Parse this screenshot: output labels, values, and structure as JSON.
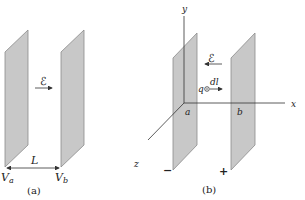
{
  "diagram": {
    "panel_a": {
      "caption": "(a)",
      "field_label": "ℰ",
      "field_direction": "right",
      "distance_label": "L",
      "left_potential": {
        "base": "V",
        "sub": "a"
      },
      "right_potential": {
        "base": "V",
        "sub": "b"
      }
    },
    "panel_b": {
      "caption": "(b)",
      "axes": {
        "x": "x",
        "y": "y",
        "z": "z"
      },
      "field_label": "ℰ",
      "field_direction": "left",
      "charge_label": "q",
      "displacement_label": "dl",
      "point_a": "a",
      "point_b": "b",
      "left_plate_sign": "−",
      "right_plate_sign": "+"
    },
    "colors": {
      "plate_fill": "#c8c8c8",
      "plate_edge": "#8a8a8a",
      "line": "#333333"
    }
  }
}
